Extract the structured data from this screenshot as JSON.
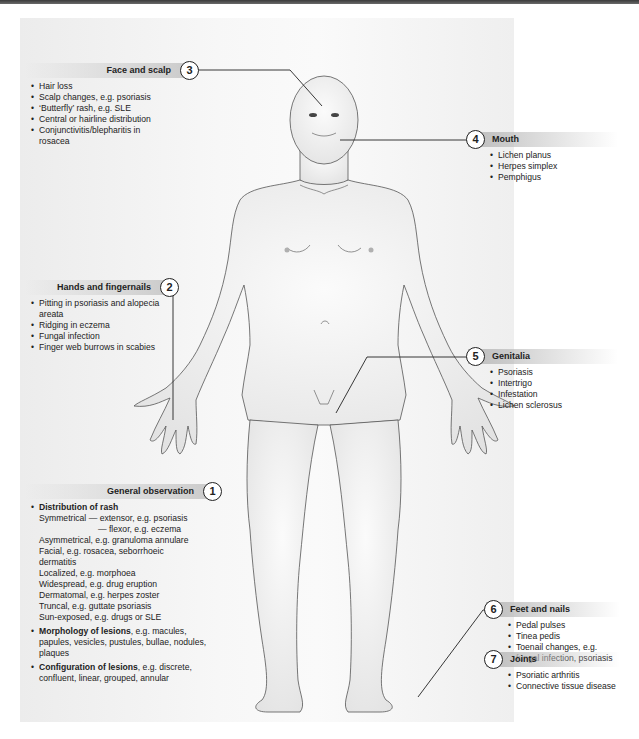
{
  "callouts": {
    "general": {
      "number": "1",
      "title": "General observation",
      "distribution_title": "Distribution of rash",
      "distribution": [
        "Symmetrical — extensor, e.g. psoriasis",
        "— flexor, e.g. eczema",
        "Asymmetrical, e.g. granuloma annulare",
        "Facial, e.g. rosacea, seborrhoeic",
        "dermatitis",
        "Localized, e.g. morphoea",
        "Widespread, e.g. drug eruption",
        "Dermatomal, e.g. herpes zoster",
        "Truncal, e.g. guttate psoriasis",
        "Sun-exposed, e.g. drugs or SLE"
      ],
      "morphology_title": "Morphology of lesions",
      "morphology_text": ", e.g. macules, papules, vesicles, pustules, bullae, nodules, plaques",
      "configuration_title": "Configuration of lesions",
      "configuration_text": ", e.g. discrete, confluent, linear, grouped, annular"
    },
    "hands": {
      "number": "2",
      "title": "Hands and fingernails",
      "items": [
        "Pitting in psoriasis and alopecia areata",
        "Ridging in eczema",
        "Fungal infection",
        "Finger web burrows in scabies"
      ]
    },
    "face": {
      "number": "3",
      "title": "Face and scalp",
      "items": [
        "Hair loss",
        "Scalp changes, e.g. psoriasis",
        "‘Butterfly’ rash, e.g. SLE",
        "Central or hairline distribution",
        "Conjunctivitis/blepharitis in rosacea"
      ]
    },
    "mouth": {
      "number": "4",
      "title": "Mouth",
      "items": [
        "Lichen planus",
        "Herpes simplex",
        "Pemphigus"
      ]
    },
    "genitalia": {
      "number": "5",
      "title": "Genitalia",
      "items": [
        "Psoriasis",
        "Intertrigo",
        "Infestation",
        "Lichen sclerosus"
      ]
    },
    "feet": {
      "number": "6",
      "title": "Feet and nails",
      "items": [
        "Pedal pulses",
        "Tinea pedis",
        "Toenail changes, e.g. fungal infection, psoriasis"
      ]
    },
    "joints": {
      "number": "7",
      "title": "Joints",
      "items": [
        "Psoriatic arthritis",
        "Connective tissue disease"
      ]
    }
  }
}
